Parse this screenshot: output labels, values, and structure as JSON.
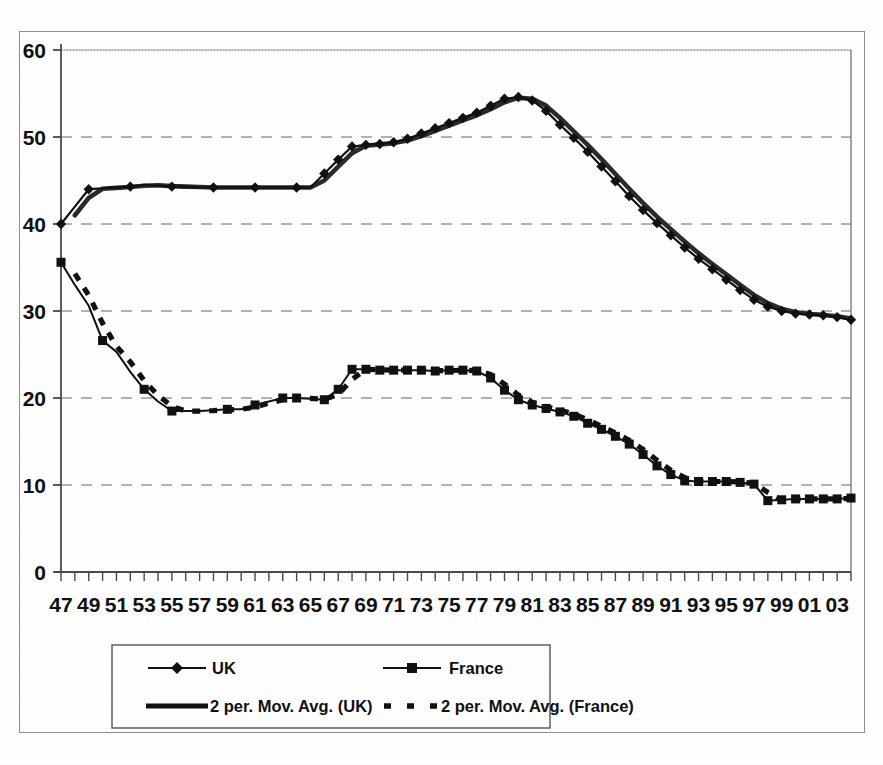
{
  "chart_data": {
    "type": "line",
    "title": "",
    "subtitle": "",
    "xlabel": "",
    "ylabel": "",
    "xlim": [
      1947,
      2004
    ],
    "ylim": [
      0,
      60
    ],
    "y_ticks": [
      0,
      10,
      20,
      30,
      40,
      50,
      60
    ],
    "grid": "horizontal-dashed",
    "legend_position": "bottom",
    "x_tick_labels": [
      "47",
      "49",
      "51",
      "53",
      "55",
      "57",
      "59",
      "61",
      "63",
      "65",
      "67",
      "69",
      "71",
      "73",
      "75",
      "77",
      "79",
      "81",
      "83",
      "85",
      "87",
      "89",
      "91",
      "93",
      "95",
      "97",
      "99",
      "01",
      "03"
    ],
    "x_minor_ticks_every": 1,
    "x": [
      1947,
      1948,
      1949,
      1950,
      1951,
      1952,
      1953,
      1954,
      1955,
      1956,
      1957,
      1958,
      1959,
      1960,
      1961,
      1962,
      1963,
      1964,
      1965,
      1966,
      1967,
      1968,
      1969,
      1970,
      1971,
      1972,
      1973,
      1974,
      1975,
      1976,
      1977,
      1978,
      1979,
      1980,
      1981,
      1982,
      1983,
      1984,
      1985,
      1986,
      1987,
      1988,
      1989,
      1990,
      1991,
      1992,
      1993,
      1994,
      1995,
      1996,
      1997,
      1998,
      1999,
      2000,
      2001,
      2002,
      2003,
      2004
    ],
    "series": [
      {
        "name": "UK",
        "marker": "diamond",
        "line_style": "solid",
        "color": "#111111",
        "values": [
          40.0,
          42.0,
          44.0,
          44.1,
          44.2,
          44.3,
          44.5,
          44.4,
          44.3,
          44.3,
          44.2,
          44.2,
          44.2,
          44.2,
          44.2,
          44.2,
          44.2,
          44.2,
          44.2,
          45.8,
          47.4,
          48.9,
          49.1,
          49.2,
          49.4,
          49.8,
          50.4,
          51.0,
          51.6,
          52.2,
          52.8,
          53.6,
          54.4,
          54.6,
          54.2,
          53.0,
          51.4,
          49.9,
          48.3,
          46.6,
          44.9,
          43.2,
          41.6,
          40.1,
          38.7,
          37.3,
          36.0,
          34.8,
          33.6,
          32.4,
          31.3,
          30.5,
          30.0,
          29.7,
          29.6,
          29.5,
          29.3,
          29.0
        ]
      },
      {
        "name": "France",
        "marker": "square",
        "line_style": "solid",
        "color": "#111111",
        "values": [
          35.6,
          33.0,
          30.6,
          26.6,
          25.3,
          23.0,
          21.0,
          19.6,
          18.5,
          18.5,
          18.5,
          18.6,
          18.7,
          18.7,
          19.2,
          19.6,
          20.0,
          20.0,
          19.9,
          19.8,
          21.0,
          23.3,
          23.3,
          23.2,
          23.2,
          23.2,
          23.2,
          23.1,
          23.2,
          23.2,
          23.1,
          22.3,
          20.9,
          19.8,
          19.2,
          18.8,
          18.4,
          17.9,
          17.1,
          16.4,
          15.6,
          14.7,
          13.5,
          12.2,
          11.2,
          10.5,
          10.4,
          10.4,
          10.4,
          10.3,
          10.1,
          8.2,
          8.3,
          8.4,
          8.4,
          8.4,
          8.4,
          8.5
        ]
      }
    ],
    "trend_series": [
      {
        "name": "2 per. Mov. Avg. (UK)",
        "based_on": "UK",
        "periods": 2,
        "line_style": "solid-thick",
        "color": "#2b2b2b"
      },
      {
        "name": "2 per. Mov. Avg. (France)",
        "based_on": "France",
        "periods": 2,
        "line_style": "dashed-thick",
        "color": "#111111"
      }
    ]
  },
  "legend": {
    "entries": [
      {
        "label": "UK",
        "style": "line-diamond"
      },
      {
        "label": "France",
        "style": "line-square"
      },
      {
        "label": "2 per. Mov. Avg. (UK)",
        "style": "thick-solid"
      },
      {
        "label": "2 per. Mov. Avg. (France)",
        "style": "thick-dashed"
      }
    ]
  },
  "axes": {
    "y_tick_labels": [
      "60",
      "50",
      "40",
      "30",
      "20",
      "10",
      "0"
    ]
  },
  "colors": {
    "ink": "#111111",
    "grid": "#9a9a9a",
    "frame": "#8e8e8e",
    "background": "#ffffff"
  }
}
